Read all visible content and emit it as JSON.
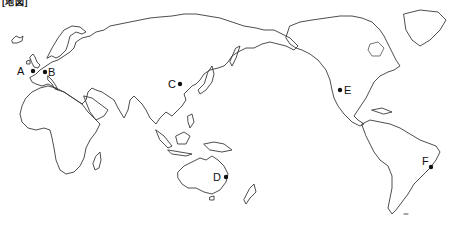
{
  "map": {
    "title": "[地図]",
    "projection": "Pacific-centered world map",
    "points": [
      {
        "id": "A",
        "label": "A",
        "region": "Western Europe (UK/London area)",
        "x": 33,
        "y": 71,
        "label_x": 17,
        "label_y": 66
      },
      {
        "id": "B",
        "label": "B",
        "region": "Central Europe",
        "x": 45,
        "y": 72,
        "label_x": 48,
        "label_y": 67
      },
      {
        "id": "C",
        "label": "C",
        "region": "Northern China (Beijing area)",
        "x": 180,
        "y": 84,
        "label_x": 168,
        "label_y": 79
      },
      {
        "id": "D",
        "label": "D",
        "region": "Eastern Australia (Brisbane area)",
        "x": 226,
        "y": 177,
        "label_x": 213,
        "label_y": 172
      },
      {
        "id": "E",
        "label": "E",
        "region": "Western USA (San Francisco area)",
        "x": 340,
        "y": 90,
        "label_x": 344,
        "label_y": 85
      },
      {
        "id": "F",
        "label": "F",
        "region": "Southeastern Brazil (Rio de Janeiro area)",
        "x": 431,
        "y": 167,
        "label_x": 422,
        "label_y": 156
      }
    ],
    "colors": {
      "coastline": "#3a3a3a",
      "background": "#ffffff",
      "points": "#111111"
    }
  }
}
